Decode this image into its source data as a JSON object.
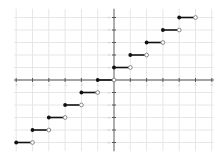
{
  "chart_data": {
    "type": "line",
    "title": "",
    "xlabel": "",
    "ylabel": "",
    "xlim": [
      -6,
      6
    ],
    "ylim": [
      -5.7,
      5.7
    ],
    "grid": true,
    "x_ticks": [
      -6,
      -5,
      -4,
      -3,
      -2,
      -1,
      1,
      2,
      3,
      4,
      5,
      6
    ],
    "y_ticks": [
      -5,
      -4,
      -3,
      -2,
      -1,
      1,
      2,
      3,
      4,
      5
    ],
    "series": [
      {
        "name": "steps",
        "segments": [
          {
            "x_start": -6,
            "x_end": -5,
            "y": -5,
            "start_closed": true,
            "end_closed": false
          },
          {
            "x_start": -5,
            "x_end": -4,
            "y": -4,
            "start_closed": true,
            "end_closed": false
          },
          {
            "x_start": -4,
            "x_end": -3,
            "y": -3,
            "start_closed": true,
            "end_closed": false
          },
          {
            "x_start": -3,
            "x_end": -2,
            "y": -2,
            "start_closed": true,
            "end_closed": false
          },
          {
            "x_start": -2,
            "x_end": -1,
            "y": -1,
            "start_closed": true,
            "end_closed": false
          },
          {
            "x_start": -1,
            "x_end": 0,
            "y": 0,
            "start_closed": true,
            "end_closed": false
          },
          {
            "x_start": 0,
            "x_end": 1,
            "y": 1,
            "start_closed": true,
            "end_closed": false
          },
          {
            "x_start": 1,
            "x_end": 2,
            "y": 2,
            "start_closed": true,
            "end_closed": false
          },
          {
            "x_start": 2,
            "x_end": 3,
            "y": 3,
            "start_closed": true,
            "end_closed": false
          },
          {
            "x_start": 3,
            "x_end": 4,
            "y": 4,
            "start_closed": true,
            "end_closed": false
          },
          {
            "x_start": 4,
            "x_end": 5,
            "y": 5,
            "start_closed": true,
            "end_closed": false
          }
        ]
      }
    ]
  },
  "layout": {
    "origin_px": [
      114,
      80
    ],
    "unit_x_px": 16.3,
    "unit_y_px": 12.5
  },
  "colors": {
    "segment": "#111111",
    "filled_dot": "#111111",
    "open_dot_stroke": "#888888",
    "axis": "#888888",
    "grid": "#e6e6e6"
  }
}
